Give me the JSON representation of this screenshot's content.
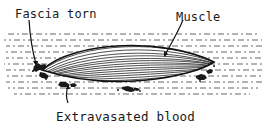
{
  "diagram": {
    "labels": {
      "fascia": "Fascia torn",
      "muscle": "Muscle",
      "blood": "Extravasated blood"
    },
    "colors": {
      "ink": "#1a1a1a",
      "background": "#ffffff",
      "hatch": "#444444"
    }
  }
}
